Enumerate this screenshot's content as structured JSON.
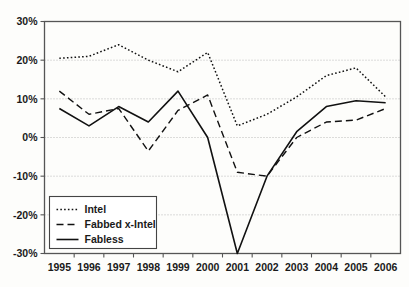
{
  "chart_data": {
    "type": "line",
    "title": "",
    "subtitle": "",
    "xlabel": "",
    "ylabel": "",
    "categories": [
      "1995",
      "1996",
      "1997",
      "1998",
      "1999",
      "2000",
      "2001",
      "2002",
      "2003",
      "2004",
      "2005",
      "2006"
    ],
    "x": [
      1995,
      1996,
      1997,
      1998,
      1999,
      2000,
      2001,
      2002,
      2003,
      2004,
      2005,
      2006
    ],
    "ylim": [
      -30,
      30
    ],
    "ytick_values": [
      30,
      20,
      10,
      0,
      -10,
      -20,
      -30
    ],
    "ytick_labels": [
      "30%",
      "20%",
      "10%",
      "0%",
      "-10%",
      "-20%",
      "-30%"
    ],
    "grid": true,
    "grid_axis": "y",
    "legend_position": "lower left",
    "units": "percent",
    "series": [
      {
        "name": "Intel",
        "style": "dotted",
        "color": "#111111",
        "values": [
          20.5,
          21,
          24,
          20,
          17,
          22,
          3,
          6,
          10.5,
          16,
          18,
          10.5
        ]
      },
      {
        "name": "Fabbed x-Intel",
        "style": "dashed",
        "color": "#111111",
        "values": [
          12,
          6,
          7.5,
          -3.5,
          7,
          11,
          -9,
          -10,
          0,
          4,
          4.5,
          7.5
        ]
      },
      {
        "name": "Fabless",
        "style": "solid",
        "color": "#111111",
        "values": [
          7.5,
          3,
          8,
          4,
          12,
          0,
          -30,
          -10,
          1.5,
          8,
          9.5,
          9
        ]
      }
    ]
  },
  "legend": {
    "items": [
      {
        "label": "Intel"
      },
      {
        "label": "Fabbed x-Intel"
      },
      {
        "label": "Fabless"
      }
    ]
  }
}
